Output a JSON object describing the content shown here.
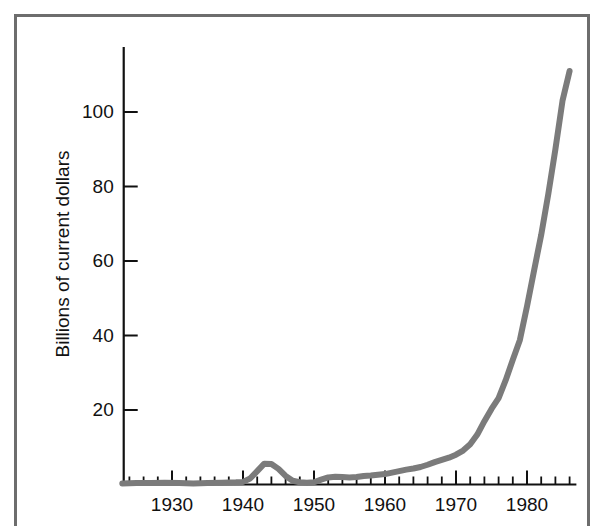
{
  "figure": {
    "background_color": "#ffffff",
    "frame_color": "#6d6d6d",
    "line_color": "#7b7b7b",
    "axis_color": "#111111"
  },
  "chart_data": {
    "type": "line",
    "title": "",
    "subtitle": "",
    "xlabel": "",
    "ylabel": "Billions of current dollars",
    "xlim": [
      1923,
      1987
    ],
    "ylim": [
      0,
      118
    ],
    "grid": false,
    "legend": false,
    "legend_position": "none",
    "x_tick_labels": [
      "1930",
      "1940",
      "1950",
      "1960",
      "1970",
      "1980"
    ],
    "x_major_ticks": [
      1930,
      1940,
      1950,
      1960,
      1970,
      1980
    ],
    "x_minor_tick_step": 2,
    "y_tick_labels": [
      "20",
      "40",
      "60",
      "80",
      "100"
    ],
    "y_major_ticks": [
      20,
      40,
      60,
      80,
      100
    ],
    "series": [
      {
        "name": "Billions of current dollars",
        "color": "#7b7b7b",
        "x": [
          1923,
          1925,
          1927,
          1929,
          1931,
          1933,
          1935,
          1937,
          1939,
          1940,
          1941,
          1942,
          1943,
          1944,
          1945,
          1946,
          1947,
          1948,
          1949,
          1950,
          1951,
          1952,
          1953,
          1954,
          1955,
          1956,
          1957,
          1958,
          1959,
          1960,
          1961,
          1962,
          1963,
          1964,
          1965,
          1966,
          1967,
          1968,
          1969,
          1970,
          1971,
          1972,
          1973,
          1974,
          1975,
          1976,
          1977,
          1978,
          1979,
          1980,
          1981,
          1982,
          1983,
          1984,
          1985,
          1986
        ],
        "y": [
          0.3,
          0.4,
          0.4,
          0.5,
          0.4,
          0.3,
          0.4,
          0.5,
          0.6,
          0.7,
          1.6,
          3.6,
          5.6,
          5.5,
          4.2,
          2.3,
          1.0,
          0.6,
          0.5,
          0.6,
          1.3,
          1.9,
          2.1,
          2.0,
          1.9,
          2.0,
          2.3,
          2.4,
          2.6,
          2.8,
          3.2,
          3.6,
          4.0,
          4.3,
          4.7,
          5.3,
          6.0,
          6.6,
          7.2,
          8.0,
          9.1,
          10.8,
          13.4,
          17.0,
          20.3,
          23.2,
          28.0,
          33.5,
          38.8,
          47.8,
          57.5,
          67.0,
          78.0,
          90.0,
          103.0,
          111.0
        ]
      }
    ]
  }
}
